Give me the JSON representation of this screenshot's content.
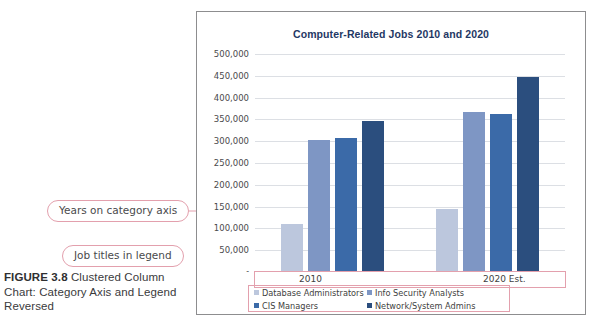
{
  "figure": {
    "label": "FIGURE 3.8",
    "caption": " Clustered Column Chart: Category Axis and Legend Reversed"
  },
  "callouts": [
    {
      "id": "years",
      "text": "Years on category axis"
    },
    {
      "id": "legend",
      "text": "Job titles in legend"
    }
  ],
  "colors": {
    "series": [
      "#bcc7dd",
      "#7e96c4",
      "#3b6aa8",
      "#2b4e7e"
    ],
    "title": "#1f3864",
    "callout_border": "#e3a0ad",
    "gridline": "#dcdfe4",
    "frame_border": "#8d8d8f"
  },
  "chart_data": {
    "type": "bar",
    "title": "Computer-Related Jobs 2010 and 2020",
    "xlabel": "",
    "ylabel": "",
    "categories": [
      "2010",
      "2020 Est."
    ],
    "ylim": [
      0,
      500000
    ],
    "ytick_values": [
      0,
      50000,
      100000,
      150000,
      200000,
      250000,
      300000,
      350000,
      400000,
      450000,
      500000
    ],
    "ytick_labels": [
      "-",
      "50,000",
      "100,000",
      "150,000",
      "200,000",
      "250,000",
      "300,000",
      "350,000",
      "400,000",
      "450,000",
      "500,000"
    ],
    "grid": true,
    "legend_position": "bottom",
    "series": [
      {
        "name": "Database Administrators",
        "values": [
          110000,
          145000
        ]
      },
      {
        "name": "Info Security Analysts",
        "values": [
          302000,
          367000
        ]
      },
      {
        "name": "CIS Managers",
        "values": [
          308000,
          362000
        ]
      },
      {
        "name": "Network/System Admins",
        "values": [
          347000,
          448000
        ]
      }
    ]
  }
}
